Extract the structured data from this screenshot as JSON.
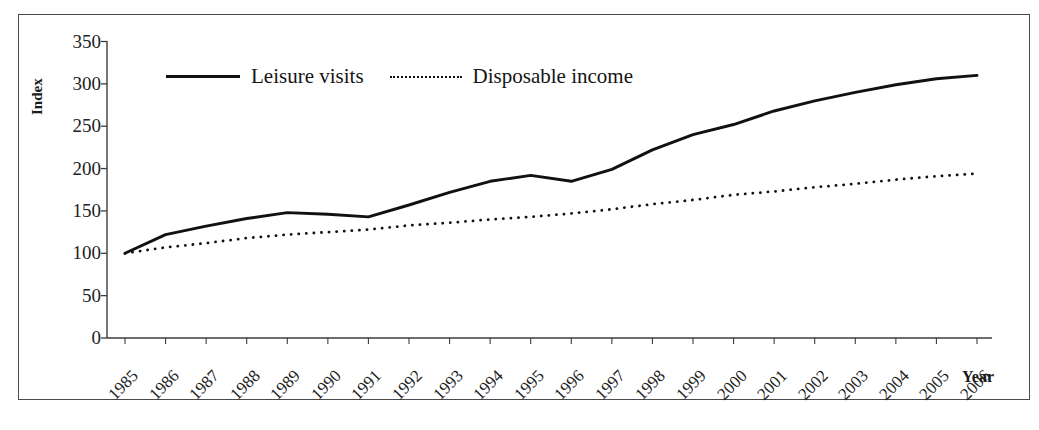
{
  "chart_data": {
    "type": "line",
    "title": "",
    "subtitle": "",
    "xlabel": "Year",
    "ylabel": "Index",
    "grid": false,
    "legend_position": "top-inside",
    "x": [
      1985,
      1986,
      1987,
      1988,
      1989,
      1990,
      1991,
      1992,
      1993,
      1994,
      1995,
      1996,
      1997,
      1998,
      1999,
      2000,
      2001,
      2002,
      2003,
      2004,
      2005,
      2006
    ],
    "categories": [
      "1985",
      "1986",
      "1987",
      "1988",
      "1989",
      "1990",
      "1991",
      "1992",
      "1993",
      "1994",
      "1995",
      "1996",
      "1997",
      "1998",
      "1999",
      "2000",
      "2001",
      "2002",
      "2003",
      "2004",
      "2005",
      "2006"
    ],
    "xlim": [
      1985,
      2006
    ],
    "ylim": [
      0,
      350
    ],
    "ytick_values": [
      0,
      50,
      100,
      150,
      200,
      250,
      300,
      350
    ],
    "ytick_labels": [
      "0",
      "50",
      "100",
      "150",
      "200",
      "250",
      "300",
      "350"
    ],
    "series": [
      {
        "name": "Leisure visits",
        "style": "solid",
        "color": "#111111",
        "values": [
          100,
          122,
          132,
          141,
          148,
          146,
          143,
          157,
          172,
          185,
          192,
          185,
          199,
          222,
          240,
          252,
          268,
          280,
          290,
          299,
          306,
          310
        ]
      },
      {
        "name": "Disposable income",
        "style": "dotted",
        "color": "#111111",
        "values": [
          100,
          107,
          112,
          118,
          122,
          125,
          128,
          133,
          136,
          140,
          143,
          147,
          152,
          158,
          163,
          169,
          173,
          178,
          182,
          187,
          191,
          194
        ]
      }
    ]
  },
  "axes": {
    "y_title": "Index",
    "x_title": "Year"
  },
  "legend": {
    "items": [
      {
        "label": "Leisure visits",
        "style": "solid"
      },
      {
        "label": "Disposable income",
        "style": "dotted"
      }
    ]
  }
}
